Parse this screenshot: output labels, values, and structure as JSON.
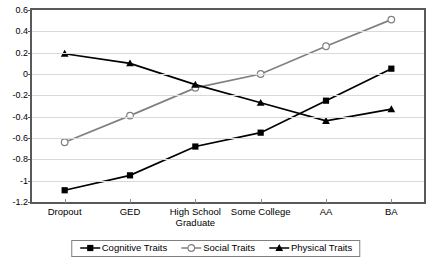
{
  "chart_data": {
    "type": "line",
    "title": "",
    "subtitle": "",
    "xlabel": "",
    "ylabel": "",
    "categories": [
      "Dropout",
      "GED",
      "High School Graduate",
      "Some College",
      "AA",
      "BA"
    ],
    "ylim": [
      -1.2,
      0.6
    ],
    "ytick_labels": [
      "0.6",
      "0.4",
      "0.2",
      "0",
      "-0.2",
      "-0.4",
      "-0.6",
      "-0.8",
      "-1",
      "-1.2"
    ],
    "ytick_values": [
      0.6,
      0.4,
      0.2,
      0,
      -0.2,
      -0.4,
      -0.6,
      -0.8,
      -1,
      -1.2
    ],
    "grid": "horizontal",
    "legend_position": "bottom",
    "series": [
      {
        "name": "Cognitive Traits",
        "values": [
          -1.09,
          -0.95,
          -0.68,
          -0.55,
          -0.25,
          0.05
        ],
        "color": "#000000",
        "marker": "filled-square"
      },
      {
        "name": "Social Traits",
        "values": [
          -0.64,
          -0.39,
          -0.13,
          0.0,
          0.26,
          0.51
        ],
        "color": "#808080",
        "marker": "open-circle"
      },
      {
        "name": "Physical Traits",
        "values": [
          0.19,
          0.1,
          -0.1,
          -0.27,
          -0.44,
          -0.33
        ],
        "color": "#000000",
        "marker": "filled-triangle"
      }
    ]
  },
  "legend": {
    "entries": [
      {
        "label": "Cognitive Traits"
      },
      {
        "label": "Social Traits"
      },
      {
        "label": "Physical Traits"
      }
    ]
  }
}
